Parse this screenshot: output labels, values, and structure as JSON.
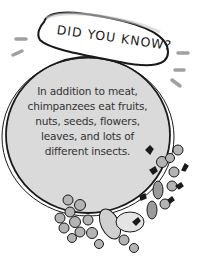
{
  "callout": {
    "title": "DID YOU KNOW?",
    "lines": [
      "In addition to meat,",
      "chimpanzees eat fruits,",
      "nuts, seeds, flowers,",
      "leaves, and lots of",
      "different insects."
    ]
  },
  "colors": {
    "circle_fill": "#d9d9d9",
    "outline": "#1a1a1a",
    "accent_dash": "#9e9e9e",
    "fruit_fill": "#b0b0b0",
    "text": "#333333"
  }
}
